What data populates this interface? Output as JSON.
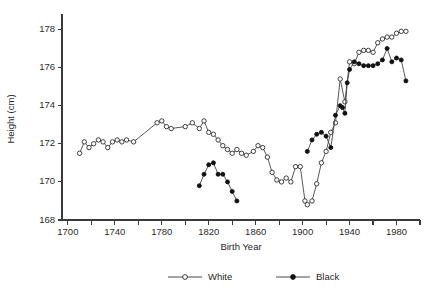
{
  "chart_data": {
    "type": "line",
    "title": "",
    "xlabel": "Birth Year",
    "ylabel": "Height (cm)",
    "xlim": [
      1695,
      2000
    ],
    "ylim": [
      168,
      178.6
    ],
    "grid": false,
    "legend_position": "bottom",
    "x_ticks_major": [
      1700,
      1740,
      1780,
      1820,
      1860,
      1900,
      1940,
      1980
    ],
    "x_ticks_minor": [
      1720,
      1760,
      1800,
      1840,
      1880,
      1920,
      1960,
      2000
    ],
    "y_ticks": [
      168,
      170,
      172,
      174,
      176,
      178
    ],
    "series": [
      {
        "name": "White",
        "marker": "open-circle",
        "points": [
          [
            1710,
            171.5
          ],
          [
            1714,
            172.1
          ],
          [
            1718,
            171.8
          ],
          [
            1722,
            172.0
          ],
          [
            1726,
            172.2
          ],
          [
            1730,
            172.1
          ],
          [
            1734,
            171.8
          ],
          [
            1738,
            172.1
          ],
          [
            1742,
            172.2
          ],
          [
            1746,
            172.1
          ],
          [
            1750,
            172.2
          ],
          [
            1756,
            172.1
          ],
          [
            1776,
            173.1
          ],
          [
            1780,
            173.2
          ],
          [
            1784,
            172.9
          ],
          [
            1788,
            172.8
          ],
          [
            1800,
            172.9
          ],
          [
            1806,
            173.1
          ],
          [
            1812,
            172.8
          ],
          [
            1816,
            173.2
          ],
          [
            1820,
            172.6
          ],
          [
            1824,
            172.5
          ],
          [
            1828,
            172.2
          ],
          [
            1832,
            171.9
          ],
          [
            1836,
            171.7
          ],
          [
            1840,
            171.5
          ],
          [
            1844,
            171.7
          ],
          [
            1848,
            171.5
          ],
          [
            1852,
            171.4
          ],
          [
            1858,
            171.6
          ],
          [
            1862,
            171.9
          ],
          [
            1866,
            171.8
          ],
          [
            1870,
            171.3
          ],
          [
            1874,
            170.5
          ],
          [
            1878,
            170.1
          ],
          [
            1882,
            170.0
          ],
          [
            1886,
            170.2
          ],
          [
            1890,
            170.0
          ],
          [
            1894,
            170.8
          ],
          [
            1898,
            170.8
          ],
          [
            1902,
            169.0
          ],
          [
            1904,
            168.8
          ],
          [
            1908,
            169.0
          ],
          [
            1912,
            169.9
          ],
          [
            1916,
            171.0
          ],
          [
            1920,
            171.6
          ],
          [
            1924,
            172.6
          ],
          [
            1928,
            173.1
          ],
          [
            1932,
            175.4
          ],
          [
            1936,
            174.2
          ],
          [
            1940,
            176.3
          ],
          [
            1944,
            176.2
          ],
          [
            1948,
            176.8
          ],
          [
            1952,
            176.9
          ],
          [
            1956,
            176.9
          ],
          [
            1960,
            176.8
          ],
          [
            1964,
            177.3
          ],
          [
            1968,
            177.5
          ],
          [
            1972,
            177.6
          ],
          [
            1976,
            177.6
          ],
          [
            1980,
            177.8
          ],
          [
            1984,
            177.9
          ],
          [
            1988,
            177.9
          ]
        ]
      },
      {
        "name": "Black",
        "marker": "filled-circle",
        "points": [
          [
            1812,
            169.8
          ],
          [
            1816,
            170.4
          ],
          [
            1820,
            170.9
          ],
          [
            1824,
            171.0
          ],
          [
            1828,
            170.4
          ],
          [
            1832,
            170.4
          ],
          [
            1836,
            170.0
          ],
          [
            1840,
            169.5
          ],
          [
            1844,
            169.0
          ],
          [
            1904,
            171.6
          ],
          [
            1908,
            172.2
          ],
          [
            1912,
            172.5
          ],
          [
            1916,
            172.6
          ],
          [
            1920,
            172.4
          ],
          [
            1924,
            171.8
          ],
          [
            1928,
            173.5
          ],
          [
            1932,
            174.0
          ],
          [
            1934,
            173.9
          ],
          [
            1936,
            173.6
          ],
          [
            1938,
            175.2
          ],
          [
            1940,
            175.9
          ],
          [
            1944,
            176.3
          ],
          [
            1948,
            176.2
          ],
          [
            1952,
            176.1
          ],
          [
            1956,
            176.1
          ],
          [
            1960,
            176.1
          ],
          [
            1964,
            176.2
          ],
          [
            1968,
            176.4
          ],
          [
            1972,
            177.0
          ],
          [
            1976,
            176.3
          ],
          [
            1980,
            176.5
          ],
          [
            1984,
            176.4
          ],
          [
            1988,
            175.3
          ]
        ]
      }
    ],
    "legend": [
      {
        "label": "White",
        "marker": "open-circle"
      },
      {
        "label": "Black",
        "marker": "filled-circle"
      }
    ],
    "colors": {
      "axis": "#3a3a3a",
      "white_series": "#ffffff",
      "black_series": "#111111",
      "background": "#ffffff"
    }
  }
}
